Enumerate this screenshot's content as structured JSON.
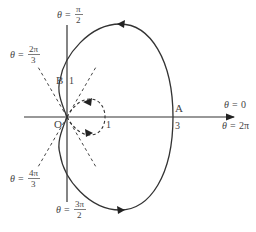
{
  "diagram": {
    "origin_label": "O",
    "point_a": {
      "label": "A",
      "r_label": "3"
    },
    "point_b": {
      "label": "B",
      "r_label": "1"
    },
    "inner_loop_label": "1",
    "angle_labels": {
      "theta_0": {
        "var": "θ",
        "eq": "=",
        "value": "0"
      },
      "theta_2pi": {
        "var": "θ",
        "eq": "=",
        "value": "2π"
      },
      "theta_pi_2": {
        "var": "θ",
        "eq": "=",
        "num": "π",
        "den": "2"
      },
      "theta_2pi_3": {
        "var": "θ",
        "eq": "=",
        "num": "2π",
        "den": "3"
      },
      "theta_4pi_3": {
        "var": "θ",
        "eq": "=",
        "num": "4π",
        "den": "3"
      },
      "theta_3pi_2": {
        "var": "θ",
        "eq": "=",
        "num": "3π",
        "den": "2"
      }
    },
    "colors": {
      "curve": "#333333",
      "axis": "#333333",
      "dashed": "#444444",
      "text": "#444444"
    }
  }
}
